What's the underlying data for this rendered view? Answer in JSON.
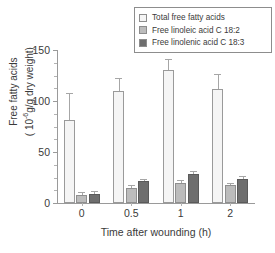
{
  "chart_data": {
    "type": "bar",
    "title": "",
    "xlabel": "Time after wounding (h)",
    "ylabel": "Free fatty acids (10-6g/g dry weight)",
    "ylabel_line1": "Free fatty acids",
    "ylabel_line2_pre": "( 10",
    "ylabel_line2_sup": "-6",
    "ylabel_line2_post": "g/g dry weight)",
    "categories": [
      "0",
      "0.5",
      "1",
      "2"
    ],
    "ylim": [
      0,
      150
    ],
    "yticks": [
      0,
      50,
      100,
      150
    ],
    "ytick_labels": [
      "0",
      "50",
      "100",
      "150"
    ],
    "yminor_ticks": [
      12.5,
      25,
      37.5,
      62.5,
      75,
      87.5,
      112.5,
      125,
      137.5
    ],
    "grid": false,
    "legend_position": "top-right",
    "series": [
      {
        "name": "Total free fatty acids",
        "color": "#f5f5f5",
        "edge_color": "#9a9a9a",
        "values": [
          81,
          110,
          130,
          112
        ],
        "errors": [
          27,
          13,
          11,
          14
        ]
      },
      {
        "name": "Free linoleic acid C 18:2",
        "color": "#bcbcbc",
        "edge_color": "#8f8f8f",
        "values": [
          8,
          15,
          20,
          18
        ],
        "errors": [
          3,
          3,
          3,
          2
        ]
      },
      {
        "name": "Free linolenic acid C 18:3",
        "color": "#6e6e6e",
        "edge_color": "#5a5a5a",
        "values": [
          9,
          22,
          28,
          24
        ],
        "errors": [
          3,
          2,
          3,
          2
        ]
      }
    ]
  },
  "legend": {
    "items": [
      {
        "label": "Total free fatty acids",
        "swatch": "#f5f5f5"
      },
      {
        "label": "Free linoleic acid C 18:2",
        "swatch": "#bcbcbc"
      },
      {
        "label": "Free linolenic acid C 18:3",
        "swatch": "#6e6e6e"
      }
    ]
  },
  "colors": {
    "axis": "#9a9a9a",
    "text": "#3a3a3a",
    "error_bar": "#a6a6a6",
    "legend_border": "#8d8d8d"
  }
}
